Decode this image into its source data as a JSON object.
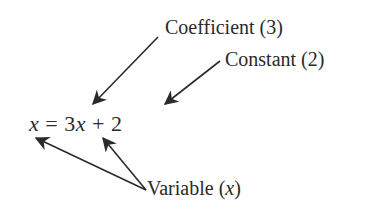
{
  "equation": {
    "lhs_var": "x",
    "equals": "=",
    "coefficient": "3",
    "rhs_var": "x",
    "plus": "+",
    "constant": "2"
  },
  "labels": {
    "coefficient": "Coefficient (3)",
    "constant": "Constant (2)",
    "variable_prefix": "Variable (",
    "variable_symbol": "x",
    "variable_suffix": ")"
  },
  "colors": {
    "ink": "#2a2a2a",
    "background": "#ffffff"
  }
}
